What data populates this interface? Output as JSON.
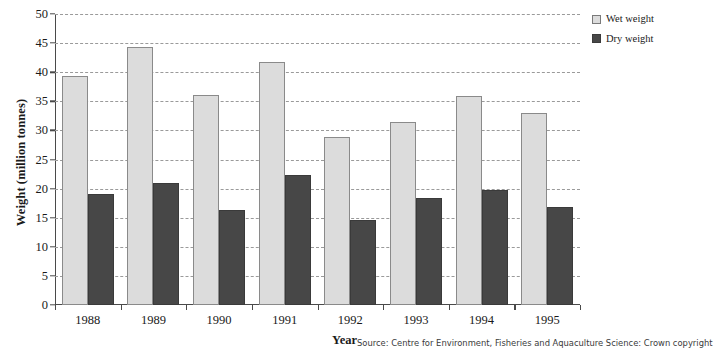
{
  "chart_data": {
    "type": "bar",
    "title": "",
    "xlabel": "Year",
    "ylabel": "Weight (million tonnes)",
    "categories": [
      "1988",
      "1989",
      "1990",
      "1991",
      "1992",
      "1993",
      "1994",
      "1995"
    ],
    "series": [
      {
        "name": "Wet weight",
        "color": "#dcdcdc",
        "values": [
          39.3,
          44.3,
          36.1,
          41.7,
          28.9,
          31.5,
          35.9,
          33.0
        ]
      },
      {
        "name": "Dry weight",
        "color": "#474747",
        "values": [
          19.0,
          20.9,
          16.3,
          22.3,
          14.6,
          18.4,
          19.7,
          16.8
        ]
      }
    ],
    "ylim": [
      0,
      50
    ],
    "yticks": [
      0,
      5,
      10,
      15,
      20,
      25,
      30,
      35,
      40,
      45,
      50
    ],
    "ytick_labels": [
      "0",
      "5",
      "10",
      "15",
      "20",
      "25",
      "30",
      "35",
      "40",
      "45",
      "50"
    ],
    "grid": "horizontal-dashed",
    "legend_position": "top-right"
  },
  "legend": {
    "items": [
      {
        "label": "Wet weight"
      },
      {
        "label": "Dry weight"
      }
    ]
  },
  "axes": {
    "y_title": "Weight (million tonnes)",
    "x_title": "Year"
  },
  "footer": {
    "source": "Source: Centre for Environment, Fisheries and Aquaculture Science: Crown copyright"
  }
}
